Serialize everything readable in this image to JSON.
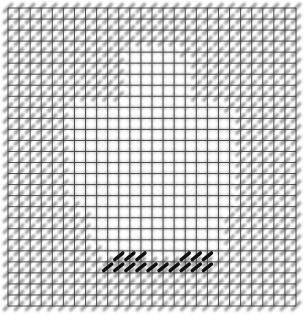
{
  "pattern": {
    "title": "",
    "grid": {
      "columns": 26,
      "rows": 27
    },
    "colors": {
      "background": "#ffffff",
      "grid_line": "#3a3a3a",
      "stitch_gray": "#9a9a9a",
      "stitch_light": "#c8c8c8",
      "stitch_black": "#111111"
    },
    "light_region_rects": [
      {
        "col0": 11,
        "col1": 15,
        "row0": 4,
        "row1": 21
      },
      {
        "col0": 6,
        "col1": 11,
        "row0": 9,
        "row1": 17
      },
      {
        "col0": 15,
        "col1": 19,
        "row0": 9,
        "row1": 17
      },
      {
        "col0": 8,
        "col1": 18,
        "row0": 17,
        "row1": 21
      }
    ],
    "black_stitches": [
      {
        "row": 22,
        "col": 9
      },
      {
        "row": 22,
        "col": 10
      },
      {
        "row": 22,
        "col": 11
      },
      {
        "row": 22,
        "col": 15
      },
      {
        "row": 22,
        "col": 16
      },
      {
        "row": 22,
        "col": 17
      },
      {
        "row": 23,
        "col": 8
      },
      {
        "row": 23,
        "col": 9
      },
      {
        "row": 23,
        "col": 10
      },
      {
        "row": 23,
        "col": 11
      },
      {
        "row": 23,
        "col": 12
      },
      {
        "row": 23,
        "col": 13
      },
      {
        "row": 23,
        "col": 14
      },
      {
        "row": 23,
        "col": 15
      },
      {
        "row": 23,
        "col": 16
      },
      {
        "row": 23,
        "col": 17
      }
    ]
  }
}
